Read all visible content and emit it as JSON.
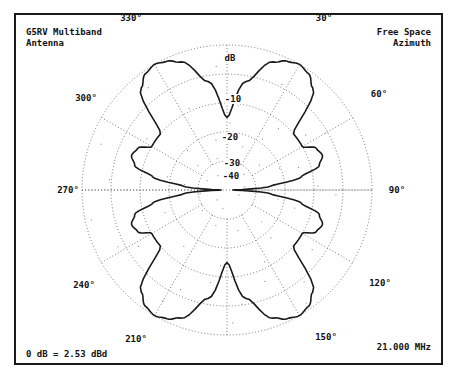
{
  "header": {
    "title_line1": "G5RV Multiband",
    "title_line2": "Antenna",
    "mode_line1": "Free Space",
    "mode_line2": "Azimuth"
  },
  "footer": {
    "reference": "0 dB = 2.53 dBd",
    "frequency": "21.000 MHz"
  },
  "angle_labels": {
    "a0": "",
    "a30": "30°",
    "a60": "60°",
    "a90": "90°",
    "a120": "120°",
    "a150": "150°",
    "a210": "210°",
    "a240": "240°",
    "a270": "270°",
    "a300": "300°",
    "a330": "330°"
  },
  "db_labels": {
    "unit": "dB",
    "d10": "-10",
    "d20": "-20",
    "d30": "-30",
    "d40": "-40"
  },
  "chart_data": {
    "type": "polar",
    "title": "G5RV Multiband Antenna",
    "subtitle": "Free Space Azimuth",
    "frequency": "21.000 MHz",
    "reference": "0 dB = 2.53 dBd",
    "radial_axis": {
      "label": "dB",
      "ticks": [
        0,
        -10,
        -20,
        -30,
        -40
      ],
      "range": [
        -50,
        0
      ]
    },
    "angular_axis": {
      "ticks_deg": [
        0,
        30,
        60,
        90,
        120,
        150,
        180,
        210,
        240,
        270,
        300,
        330
      ],
      "direction": "clockwise",
      "zero": "top"
    },
    "grid": true,
    "series": [
      {
        "name": "Azimuth pattern",
        "angles_deg": [
          0,
          10,
          20,
          25,
          30,
          35,
          40,
          50,
          60,
          65,
          70,
          75,
          80,
          85,
          90,
          95,
          100,
          105,
          110,
          115,
          120,
          130,
          140,
          145,
          150,
          155,
          160,
          170,
          180
        ],
        "gain_db": [
          -25,
          -12,
          -3,
          -1,
          0,
          -1,
          -4,
          -20,
          -20,
          -16,
          -15,
          -17,
          -24,
          -35,
          -48,
          -35,
          -24,
          -17,
          -15,
          -16,
          -20,
          -20,
          -4,
          -1,
          0,
          -1,
          -3,
          -12,
          -25
        ],
        "symmetry": "mirrored about 0-180 axis"
      }
    ]
  }
}
